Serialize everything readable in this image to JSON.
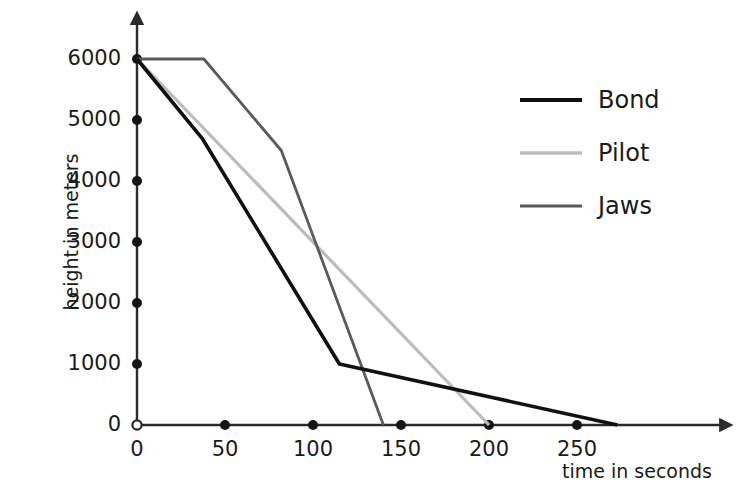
{
  "chart_data": {
    "type": "line",
    "title": "",
    "xlabel": "time in seconds",
    "ylabel": "height in meters",
    "xlim": [
      0,
      290
    ],
    "ylim": [
      0,
      6300
    ],
    "xticks": [
      0,
      50,
      100,
      150,
      200,
      250
    ],
    "yticks": [
      0,
      1000,
      2000,
      3000,
      4000,
      5000,
      6000
    ],
    "xtick_labels": [
      "0",
      "50",
      "100",
      "150",
      "200",
      "250"
    ],
    "ytick_labels": [
      "0",
      "1000",
      "2000",
      "3000",
      "4000",
      "5000",
      "6000"
    ],
    "grid": false,
    "legend_position": "top-right",
    "series": [
      {
        "name": "Bond",
        "color": "#111111",
        "width": 3.6,
        "points": [
          [
            0,
            6000
          ],
          [
            37,
            4700
          ],
          [
            115,
            1000
          ],
          [
            273,
            0
          ]
        ]
      },
      {
        "name": "Pilot",
        "color": "#bcbcbc",
        "width": 3.2,
        "points": [
          [
            0,
            6000
          ],
          [
            200,
            0
          ]
        ]
      },
      {
        "name": "Jaws",
        "color": "#5a5a5a",
        "width": 2.8,
        "points": [
          [
            0,
            6000
          ],
          [
            38,
            6000
          ],
          [
            82,
            4500
          ],
          [
            140,
            0
          ]
        ]
      }
    ]
  },
  "legend": {
    "entries": [
      {
        "label": "Bond",
        "color": "#111111",
        "width": 4.2
      },
      {
        "label": "Pilot",
        "color": "#bcbcbc",
        "width": 3.6
      },
      {
        "label": "Jaws",
        "color": "#5a5a5a",
        "width": 3.2
      }
    ]
  },
  "axes": {
    "y_title": "height in meters",
    "x_title": "time in seconds"
  }
}
